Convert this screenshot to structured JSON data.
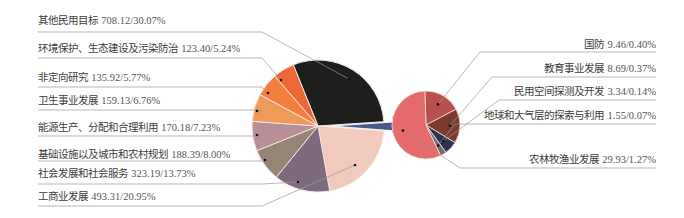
{
  "chart_data": {
    "type": "pie",
    "subtype": "pie-of-pie",
    "title": "",
    "unit_note": "value / share of total",
    "main_pie": [
      {
        "label": "其他民用目标",
        "value": 708.12,
        "percent": 30.07,
        "color": "#1e1e1c"
      },
      {
        "label": "工商业发展",
        "value": 493.31,
        "percent": 20.95,
        "color": "#f2c9bd"
      },
      {
        "label": "社会发展和社会服务",
        "value": 323.19,
        "percent": 13.73,
        "color": "#7e6a7e"
      },
      {
        "label": "基础设施以及城市和农村规划",
        "value": 188.39,
        "percent": 8.0,
        "color": "#968574"
      },
      {
        "label": "能源生产、分配和合理利用",
        "value": 170.18,
        "percent": 7.23,
        "color": "#b88f96"
      },
      {
        "label": "卫生事业发展",
        "value": 159.13,
        "percent": 6.76,
        "color": "#ee9a58"
      },
      {
        "label": "非定向研究",
        "value": 135.92,
        "percent": 5.77,
        "color": "#f47e3e"
      },
      {
        "label": "环境保护、生态建设及污染防治",
        "value": 123.4,
        "percent": 5.24,
        "color": "#ee6836"
      }
    ],
    "other_aggregate": {
      "label": "其他",
      "percent": 2.25,
      "color": "#4a5a86"
    },
    "secondary_pie": [
      {
        "label": "农林牧渔业发展",
        "value": 29.93,
        "percent": 1.27,
        "color": "#e56a6a"
      },
      {
        "label": "国防",
        "value": 9.46,
        "percent": 0.4,
        "color": "#b8504e"
      },
      {
        "label": "教育事业发展",
        "value": 8.69,
        "percent": 0.37,
        "color": "#7a3a2c"
      },
      {
        "label": "民用空间探测及开发",
        "value": 3.34,
        "percent": 0.14,
        "color": "#2f3150"
      },
      {
        "label": "地球和大气层的探索与利用",
        "value": 1.55,
        "percent": 0.07,
        "color": "#6f6f6f"
      }
    ],
    "legend": "none (leader-line labels)"
  },
  "labels_left": [
    {
      "name": "其他民用目标",
      "text": "708.12/30.07%"
    },
    {
      "name": "环境保护、生态建设及污染防治",
      "text": "123.40/5.24%"
    },
    {
      "name": "非定向研究",
      "text": "135.92/5.77%"
    },
    {
      "name": "卫生事业发展",
      "text": "159.13/6.76%"
    },
    {
      "name": "能源生产、分配和合理利用",
      "text": "170.18/7.23%"
    },
    {
      "name": "基础设施以及城市和农村规划",
      "text": "188.39/8.00%"
    },
    {
      "name": "社会发展和社会服务",
      "text": "323.19/13.73%"
    },
    {
      "name": "工商业发展",
      "text": "493.31/20.95%"
    }
  ],
  "labels_right": [
    {
      "name": "国防",
      "text": "9.46/0.40%"
    },
    {
      "name": "教育事业发展",
      "text": "8.69/0.37%"
    },
    {
      "name": "民用空间探测及开发",
      "text": "3.34/0.14%"
    },
    {
      "name": "地球和大气层的探索与利用",
      "text": "1.55/0.07%"
    },
    {
      "name": "农林牧渔业发展",
      "text": "29.93/1.27%"
    }
  ]
}
